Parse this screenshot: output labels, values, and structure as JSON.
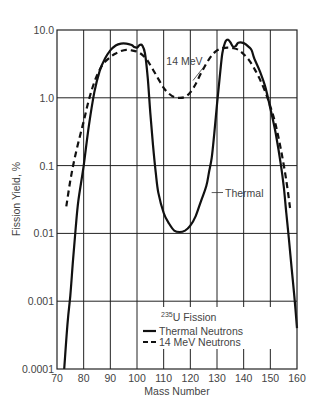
{
  "chart_data": {
    "type": "line",
    "title": "",
    "xlabel": "Mass Number",
    "ylabel": "Fission Yield, %",
    "xlim": [
      70,
      160
    ],
    "ylim": [
      0.0001,
      10.0
    ],
    "yscale": "log",
    "grid": true,
    "x_ticks": [
      70,
      80,
      90,
      100,
      110,
      120,
      130,
      140,
      150,
      160
    ],
    "x_tick_labels": [
      "70",
      "80",
      "90",
      "100",
      "110",
      "120",
      "130",
      "140",
      "150",
      "160"
    ],
    "y_ticks": [
      0.0001,
      0.001,
      0.01,
      0.1,
      1.0,
      10.0
    ],
    "y_tick_labels": [
      "0.0001",
      "0.001",
      "0.01",
      "0.1",
      "1.0",
      "10.0"
    ],
    "legend": {
      "title": "235U Fission",
      "title_superscript": "235",
      "title_rest": "U Fission",
      "position": "lower center",
      "entries": [
        "Thermal Neutrons",
        "14 MeV Neutrons"
      ]
    },
    "annotations": [
      {
        "text": "14 MeV",
        "x": 111,
        "y": 3.0,
        "arrow_to": [
          121,
          1.8
        ]
      },
      {
        "text": "Thermal",
        "x": 133,
        "y": 0.035,
        "arrow_to": [
          128,
          0.04
        ]
      }
    ],
    "series": [
      {
        "name": "Thermal Neutrons",
        "style": "solid",
        "points": [
          [
            72.7,
            0.0001
          ],
          [
            74,
            0.0005
          ],
          [
            75,
            0.0012
          ],
          [
            76,
            0.004
          ],
          [
            77,
            0.012
          ],
          [
            78,
            0.03
          ],
          [
            80,
            0.1
          ],
          [
            82,
            0.4
          ],
          [
            84,
            1.2
          ],
          [
            86,
            2.5
          ],
          [
            88,
            3.8
          ],
          [
            90,
            5.0
          ],
          [
            92,
            5.9
          ],
          [
            94,
            6.3
          ],
          [
            96,
            6.3
          ],
          [
            98,
            6.0
          ],
          [
            99,
            5.6
          ],
          [
            100,
            5.5
          ],
          [
            101,
            6.0
          ],
          [
            102,
            5.9
          ],
          [
            103,
            4.5
          ],
          [
            104,
            2.0
          ],
          [
            105,
            0.6
          ],
          [
            106,
            0.2
          ],
          [
            107,
            0.08
          ],
          [
            108,
            0.04
          ],
          [
            110,
            0.02
          ],
          [
            112,
            0.014
          ],
          [
            114,
            0.011
          ],
          [
            116,
            0.0105
          ],
          [
            118,
            0.011
          ],
          [
            120,
            0.013
          ],
          [
            122,
            0.018
          ],
          [
            124,
            0.03
          ],
          [
            126,
            0.05
          ],
          [
            127,
            0.08
          ],
          [
            128,
            0.13
          ],
          [
            129,
            0.3
          ],
          [
            130,
            0.8
          ],
          [
            131,
            2.0
          ],
          [
            132,
            4.5
          ],
          [
            133,
            6.5
          ],
          [
            134,
            7.2
          ],
          [
            135,
            6.6
          ],
          [
            136,
            5.7
          ],
          [
            137,
            5.8
          ],
          [
            138,
            6.5
          ],
          [
            140,
            6.4
          ],
          [
            142,
            5.6
          ],
          [
            143,
            5.0
          ],
          [
            144,
            3.8
          ],
          [
            146,
            2.5
          ],
          [
            148,
            1.5
          ],
          [
            150,
            0.7
          ],
          [
            152,
            0.3
          ],
          [
            154,
            0.1
          ],
          [
            155,
            0.05
          ],
          [
            156,
            0.02
          ],
          [
            157,
            0.008
          ],
          [
            158,
            0.003
          ],
          [
            159,
            0.0012
          ],
          [
            160,
            0.0004
          ]
        ]
      },
      {
        "name": "14 MeV Neutrons",
        "style": "dashed",
        "points": [
          [
            73.5,
            0.025
          ],
          [
            75,
            0.06
          ],
          [
            77,
            0.15
          ],
          [
            80,
            0.45
          ],
          [
            82,
            0.95
          ],
          [
            84,
            1.7
          ],
          [
            86,
            2.6
          ],
          [
            88,
            3.4
          ],
          [
            90,
            4.0
          ],
          [
            92,
            4.5
          ],
          [
            94,
            4.9
          ],
          [
            96,
            5.1
          ],
          [
            98,
            5.0
          ],
          [
            100,
            4.8
          ],
          [
            102,
            4.3
          ],
          [
            104,
            3.5
          ],
          [
            106,
            2.6
          ],
          [
            108,
            1.9
          ],
          [
            110,
            1.4
          ],
          [
            112,
            1.15
          ],
          [
            114,
            1.02
          ],
          [
            116,
            1.0
          ],
          [
            118,
            1.03
          ],
          [
            120,
            1.2
          ],
          [
            122,
            1.6
          ],
          [
            124,
            2.3
          ],
          [
            126,
            3.2
          ],
          [
            128,
            4.2
          ],
          [
            130,
            5.0
          ],
          [
            132,
            5.4
          ],
          [
            134,
            5.5
          ],
          [
            136,
            5.4
          ],
          [
            138,
            5.1
          ],
          [
            140,
            4.4
          ],
          [
            142,
            3.6
          ],
          [
            144,
            2.7
          ],
          [
            146,
            1.9
          ],
          [
            148,
            1.25
          ],
          [
            150,
            0.75
          ],
          [
            152,
            0.4
          ],
          [
            154,
            0.17
          ],
          [
            156,
            0.06
          ],
          [
            157.5,
            0.022
          ]
        ]
      }
    ]
  },
  "colors": {
    "curve": "#111111",
    "grid": "#222222",
    "text": "#444444",
    "background": "#ffffff"
  }
}
